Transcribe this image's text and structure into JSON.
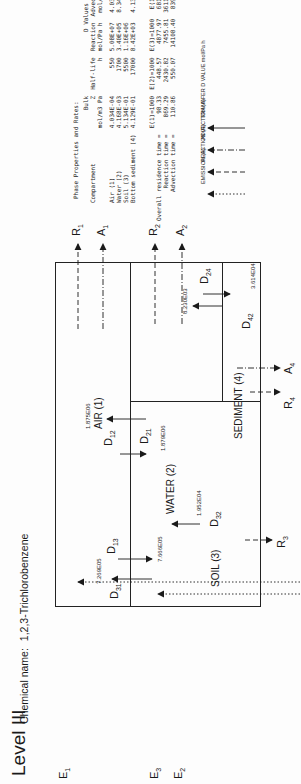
{
  "title": "Level III",
  "chemical": {
    "label": "Chemical name:",
    "name": "1,2,3-Trichlorobenzene"
  },
  "compartments": {
    "air": "AIR (1)",
    "water": "WATER (2)",
    "soil": "SOIL (3)",
    "sediment": "SEDIMENT (4)"
  },
  "transfers": {
    "D12": {
      "label": "D",
      "sub": "12",
      "value": "1.879E06"
    },
    "D21": {
      "label": "D",
      "sub": "21",
      "value": "1.875E06"
    },
    "D13": {
      "label": "D",
      "sub": "13",
      "value": "7.666E05"
    },
    "D31": {
      "label": "D",
      "sub": "31",
      "value": "7.269E05"
    },
    "D32": {
      "label": "D",
      "sub": "32",
      "value": "1.952E04"
    },
    "D24": {
      "label": "D",
      "sub": "24",
      "value": "3.614E04"
    },
    "D42": {
      "label": "D",
      "sub": "42",
      "value": "8.230E03"
    }
  },
  "flows": {
    "E1": {
      "label": "E",
      "sub": "1"
    },
    "E2": {
      "label": "E",
      "sub": "2"
    },
    "E3": {
      "label": "E",
      "sub": "3"
    },
    "R1": {
      "label": "R",
      "sub": "1"
    },
    "R2": {
      "label": "R",
      "sub": "2"
    },
    "R3": {
      "label": "R",
      "sub": "3"
    },
    "R4": {
      "label": "R",
      "sub": "4"
    },
    "A1": {
      "label": "A",
      "sub": "1"
    },
    "A2": {
      "label": "A",
      "sub": "2"
    },
    "A4": {
      "label": "A",
      "sub": "4"
    }
  },
  "phase_table": {
    "title": "Phase Properties and Rates:",
    "headers": {
      "compartment": "Compartment",
      "bulk_z": [
        "Bulk",
        "Z",
        "mol/m3 Pa"
      ],
      "half_life": [
        "Half-life",
        "h"
      ],
      "d_values": "D Values",
      "reaction": [
        "Reaction",
        "mol/Pa h"
      ],
      "advection": [
        "Advection",
        "mol/Pa h"
      ]
    },
    "rows": [
      {
        "compartment": "Air (1)",
        "z": "4.034E-04",
        "half_life": "550",
        "reaction": "5.08E+07",
        "advection": "4.03E+08"
      },
      {
        "compartment": "Water (2)",
        "z": "4.168E-03",
        "half_life": "1700",
        "reaction": "3.40E+05",
        "advection": "8.34E+05"
      },
      {
        "compartment": "Soil (3)",
        "z": "5.134E-01",
        "half_life": "5500",
        "reaction": "1.16E+06",
        "advection": ""
      },
      {
        "compartment": "Bottom sediment (4)",
        "z": "4.129E-01",
        "half_life": "17000",
        "reaction": "8.42E+03",
        "advection": "4.13E+03"
      }
    ]
  },
  "residence_table": {
    "headers": [
      "E(1)=1000",
      "E(2)=1000",
      "E(3)=1000",
      "E(1,2,3)"
    ],
    "rows": [
      {
        "label": "Overall residence time =",
        "values": [
          "98.33",
          "448.57",
          "4877.97",
          "681.36 h"
        ]
      },
      {
        "label": "Reaction time =",
        "values": [
          "869.29",
          "2430.82",
          "7455.81",
          "3611.77 h"
        ]
      },
      {
        "label": "Advection time =",
        "values": [
          "110.86",
          "550.07",
          "14108.40",
          "839.79 h"
        ]
      }
    ]
  },
  "legend": [
    {
      "style": "emission",
      "label": "EMISSION (E)"
    },
    {
      "style": "reaction",
      "label": "REACTION (R)"
    },
    {
      "style": "advection",
      "label": "ADVECTION (A)"
    },
    {
      "style": "transfer",
      "label": "TRANSFER D VALUE mol/Pa h"
    }
  ],
  "colors": {
    "ink": "#1a1a1a",
    "paper": "#fdfdfd"
  }
}
